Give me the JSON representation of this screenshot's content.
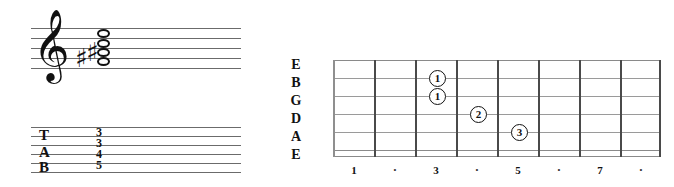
{
  "notation": {
    "clef": "treble-clef",
    "clef_glyph": "𝄞",
    "accidentals": [
      {
        "glyph": "♯",
        "name": "sharp-1",
        "x": 44,
        "y": 17
      },
      {
        "glyph": "♯",
        "name": "sharp-2",
        "x": 55,
        "y": 11
      }
    ],
    "noteheads": [
      {
        "name": "notehead-top",
        "type": "open",
        "x": 66,
        "y": 4
      },
      {
        "name": "notehead-upper",
        "type": "open",
        "x": 66,
        "y": 14
      },
      {
        "name": "notehead-middle",
        "type": "open",
        "x": 66,
        "y": 23
      },
      {
        "name": "notehead-lower",
        "type": "open",
        "x": 66,
        "y": 32
      }
    ],
    "staff_lines": 5
  },
  "tablature": {
    "letters": [
      {
        "label": "T",
        "x": 8,
        "y": 2
      },
      {
        "label": "A",
        "x": 8,
        "y": 19
      },
      {
        "label": "B",
        "x": 8,
        "y": 34
      }
    ],
    "numbers": [
      {
        "value": "3",
        "x": 65,
        "y": 1
      },
      {
        "value": "3",
        "x": 65,
        "y": 12
      },
      {
        "value": "4",
        "x": 65,
        "y": 23
      },
      {
        "value": "5",
        "x": 65,
        "y": 34
      }
    ],
    "staff_lines": 6
  },
  "fretboard": {
    "string_labels": [
      "E",
      "B",
      "G",
      "D",
      "A",
      "E"
    ],
    "fret_numbers": [
      "1",
      "·",
      "3",
      "·",
      "5",
      "·",
      "7",
      "·"
    ],
    "fret_count": 8,
    "string_count": 6,
    "markers": [
      {
        "finger": "1",
        "string": 2,
        "fret": 3,
        "x": 96,
        "y": 14
      },
      {
        "finger": "1",
        "string": 3,
        "fret": 3,
        "x": 96,
        "y": 32
      },
      {
        "finger": "2",
        "string": 4,
        "fret": 4,
        "x": 137,
        "y": 50
      },
      {
        "finger": "3",
        "string": 5,
        "fret": 5,
        "x": 178,
        "y": 68
      }
    ]
  },
  "colors": {
    "background": "#ffffff",
    "ink": "#111111",
    "staff_line": "#6b6b6b",
    "string_line": "#9a9a9a",
    "fret_line": "#4a4a4a"
  }
}
